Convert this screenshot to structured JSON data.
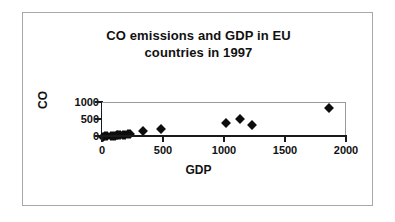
{
  "chart_data": {
    "type": "scatter",
    "title": "CO emissions and GDP in EU countries in 1997",
    "title_line1": "CO emissions and GDP in EU",
    "title_line2": "countries in 1997",
    "xlabel": "GDP",
    "ylabel": "CO",
    "xlim": [
      0,
      2000
    ],
    "ylim": [
      0,
      1000
    ],
    "xticks": [
      0,
      500,
      1000,
      1500,
      2000
    ],
    "yticks": [
      0,
      500,
      1000
    ],
    "xtick_labels": [
      "0",
      "500",
      "1000",
      "1500",
      "2000"
    ],
    "ytick_labels": [
      "0",
      "500",
      "1000"
    ],
    "grid": false,
    "legend": "none",
    "marker": "diamond",
    "marker_color": "#0d0d0d",
    "points": [
      {
        "x": 10,
        "y": 10
      },
      {
        "x": 25,
        "y": 15
      },
      {
        "x": 45,
        "y": 20
      },
      {
        "x": 70,
        "y": 30
      },
      {
        "x": 90,
        "y": 35
      },
      {
        "x": 105,
        "y": 40
      },
      {
        "x": 120,
        "y": 45
      },
      {
        "x": 135,
        "y": 50
      },
      {
        "x": 150,
        "y": 55
      },
      {
        "x": 170,
        "y": 60
      },
      {
        "x": 190,
        "y": 70
      },
      {
        "x": 210,
        "y": 80
      },
      {
        "x": 230,
        "y": 90
      },
      {
        "x": 340,
        "y": 175
      },
      {
        "x": 480,
        "y": 230
      },
      {
        "x": 1015,
        "y": 420
      },
      {
        "x": 1135,
        "y": 540
      },
      {
        "x": 1230,
        "y": 340
      },
      {
        "x": 1860,
        "y": 850
      }
    ]
  }
}
